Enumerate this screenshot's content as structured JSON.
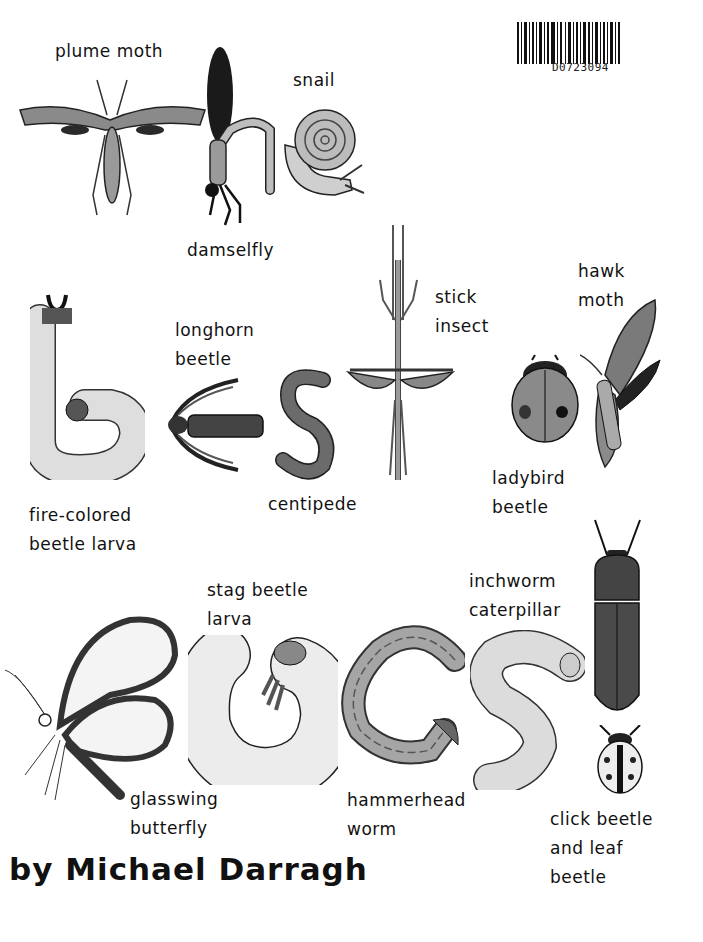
{
  "barcode": {
    "code": "D0723094"
  },
  "title_word_1": "the",
  "title_word_2": "best",
  "title_word_3": "bugs",
  "labels": {
    "plume_moth": [
      "plume moth"
    ],
    "snail": [
      "snail"
    ],
    "damselfly": [
      "damselfly"
    ],
    "stick_insect": [
      "stick",
      "insect"
    ],
    "hawk_moth": [
      "hawk",
      "moth"
    ],
    "longhorn_beetle": [
      "longhorn",
      "beetle"
    ],
    "fire_colored_larva": [
      "fire-colored",
      "beetle larva"
    ],
    "centipede": [
      "centipede"
    ],
    "ladybird_beetle": [
      "ladybird",
      "beetle"
    ],
    "stag_beetle_larva": [
      "stag beetle",
      "larva"
    ],
    "inchworm": [
      "inchworm",
      "caterpillar"
    ],
    "glasswing": [
      "glasswing",
      "butterfly"
    ],
    "hammerhead": [
      "hammerhead",
      "worm"
    ],
    "click_leaf_beetle": [
      "click beetle",
      "and leaf",
      "beetle"
    ]
  },
  "author": "by Michael Darragh",
  "colors": {
    "ink": "#111111",
    "mid_gray": "#8a8a8a",
    "light_gray": "#d9d9d9",
    "dark_gray": "#3a3a3a"
  }
}
